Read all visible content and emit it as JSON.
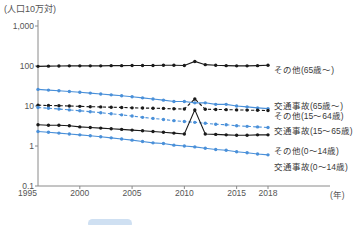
{
  "chart_data": {
    "type": "line",
    "title": "",
    "unit_label": "(人口10万対)",
    "xlabel": "(年)",
    "ylabel": "",
    "yscale": "log",
    "ylim": [
      0.1,
      1000
    ],
    "yticks": [
      "1,000",
      "100",
      "10",
      "1",
      "0.1"
    ],
    "ytick_values": [
      1000,
      100,
      10,
      1,
      0.1
    ],
    "xlim": [
      1996,
      2018
    ],
    "xticks": [
      "1995",
      "2000",
      "2005",
      "2010",
      "2015",
      "2018"
    ],
    "xtick_values": [
      1995,
      2000,
      2005,
      2010,
      2015,
      2018
    ],
    "grid": false,
    "legend_position": "right",
    "x": [
      1996,
      1997,
      1998,
      1999,
      2000,
      2001,
      2002,
      2003,
      2004,
      2005,
      2006,
      2007,
      2008,
      2009,
      2010,
      2011,
      2012,
      2013,
      2014,
      2015,
      2016,
      2017,
      2018
    ],
    "series": [
      {
        "name": "その他(65歳〜)",
        "color": "#1a1a1a",
        "dash": "solid",
        "values": [
          98,
          99,
          100,
          101,
          101,
          101,
          101,
          102,
          102,
          103,
          103,
          103,
          104,
          104,
          103,
          130,
          108,
          104,
          102,
          101,
          101,
          102,
          104
        ]
      },
      {
        "name": "交通事故(65歳〜)",
        "color": "#4a90d9",
        "dash": "solid",
        "values": [
          26,
          25,
          24,
          23,
          22,
          21,
          20,
          19,
          18,
          17,
          16,
          15,
          14,
          13,
          13,
          12,
          12,
          11,
          11,
          10,
          9.5,
          9.0,
          8.6
        ]
      },
      {
        "name": "その他(15〜64歳)",
        "color": "#1a1a1a",
        "dash": "dashed",
        "values": [
          10.5,
          10.3,
          10.2,
          10.0,
          9.8,
          9.6,
          9.5,
          9.3,
          9.2,
          9.0,
          8.9,
          8.8,
          8.7,
          8.5,
          8.4,
          15.0,
          8.3,
          8.2,
          8.1,
          8.0,
          7.9,
          7.8,
          7.7
        ]
      },
      {
        "name": "交通事故(15〜65歳)",
        "color": "#4a90d9",
        "dash": "dashed",
        "values": [
          9.2,
          8.8,
          8.4,
          8.0,
          7.6,
          7.2,
          6.8,
          6.4,
          6.0,
          5.6,
          5.2,
          4.9,
          4.6,
          4.3,
          4.1,
          3.9,
          3.7,
          3.5,
          3.4,
          3.2,
          3.1,
          3.0,
          2.9
        ]
      },
      {
        "name": "その他(0〜14歳)",
        "color": "#1a1a1a",
        "dash": "solid",
        "values": [
          3.4,
          3.3,
          3.3,
          3.2,
          3.0,
          2.9,
          2.8,
          2.7,
          2.6,
          2.5,
          2.4,
          2.3,
          2.2,
          2.1,
          2.0,
          8.0,
          2.0,
          1.95,
          1.9,
          1.85,
          1.85,
          1.9,
          1.9
        ]
      },
      {
        "name": "交通事故(0〜14歳)",
        "color": "#4a90d9",
        "dash": "solid",
        "values": [
          2.3,
          2.2,
          2.1,
          2.0,
          1.9,
          1.8,
          1.7,
          1.6,
          1.5,
          1.4,
          1.3,
          1.2,
          1.15,
          1.05,
          1.0,
          0.95,
          0.88,
          0.82,
          0.78,
          0.72,
          0.68,
          0.63,
          0.6
        ]
      }
    ],
    "legend_entries": [
      {
        "label": "その他(65歳〜)",
        "y": 66
      },
      {
        "label": "交通事故(65歳〜)",
        "y": 102
      },
      {
        "label": "その他(15〜64歳)",
        "y": 112
      },
      {
        "label": "交通事故(15〜65歳)",
        "y": 127
      },
      {
        "label": "その他(0〜14歳)",
        "y": 147
      },
      {
        "label": "交通事故(0〜14歳)",
        "y": 163
      }
    ]
  },
  "colors": {
    "black_series": "#1a1a1a",
    "blue_series": "#4a90d9",
    "axis": "#8a8a8a",
    "text": "#4a4a4a",
    "chip": "#cfe0f2"
  }
}
